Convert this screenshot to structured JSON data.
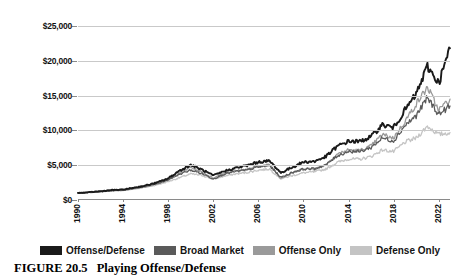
{
  "caption": {
    "figure_number": "FIGURE 20.5",
    "title": "Playing Offense/Defense"
  },
  "legend": {
    "position": "bottom",
    "items": [
      {
        "label": "Offense/Defense",
        "color": "#1a1a1a"
      },
      {
        "label": "Broad Market",
        "color": "#5a5a5a"
      },
      {
        "label": "Offense Only",
        "color": "#9a9a9a"
      },
      {
        "label": "Defense Only",
        "color": "#c4c4c4"
      }
    ]
  },
  "axes": {
    "y_ticks": [
      "$0",
      "$5,000",
      "$10,000",
      "$15,000",
      "$20,000",
      "$25,000"
    ],
    "x_ticks": [
      "1990",
      "1994",
      "1998",
      "2002",
      "2006",
      "2010",
      "2014",
      "2018",
      "2022"
    ]
  },
  "chart_data": {
    "type": "line",
    "title": "Playing Offense/Defense",
    "xlabel": "",
    "ylabel": "",
    "ylim": [
      0,
      25000
    ],
    "xlim": [
      1990,
      2023
    ],
    "grid": true,
    "legend_position": "bottom",
    "x": [
      1990,
      1991,
      1992,
      1993,
      1994,
      1995,
      1996,
      1997,
      1998,
      1999,
      2000,
      2001,
      2002,
      2003,
      2004,
      2005,
      2006,
      2007,
      2008,
      2009,
      2010,
      2011,
      2012,
      2013,
      2014,
      2015,
      2016,
      2017,
      2018,
      2019,
      2020,
      2021,
      2022,
      2023
    ],
    "series": [
      {
        "name": "Offense/Defense",
        "color": "#1a1a1a",
        "values": [
          1000,
          1120,
          1260,
          1420,
          1500,
          1780,
          2080,
          2500,
          3100,
          4200,
          5050,
          4350,
          3500,
          4150,
          4600,
          4950,
          5450,
          5600,
          3900,
          4700,
          5450,
          5550,
          6250,
          7700,
          8450,
          8400,
          9100,
          10800,
          10400,
          12900,
          15200,
          19200,
          16800,
          21800
        ]
      },
      {
        "name": "Broad Market",
        "color": "#5a5a5a",
        "values": [
          1000,
          1100,
          1220,
          1360,
          1420,
          1680,
          1950,
          2350,
          2900,
          3700,
          4300,
          3800,
          3050,
          3750,
          4100,
          4300,
          4750,
          4950,
          3250,
          3950,
          4450,
          4500,
          5050,
          6350,
          7000,
          6950,
          7550,
          8900,
          8500,
          10700,
          12100,
          14700,
          12300,
          13500
        ]
      },
      {
        "name": "Offense Only",
        "color": "#9a9a9a",
        "values": [
          1000,
          1090,
          1210,
          1340,
          1400,
          1650,
          1920,
          2320,
          2900,
          3900,
          4700,
          4000,
          3150,
          3850,
          4200,
          4400,
          4850,
          5050,
          3150,
          3900,
          4500,
          4450,
          5100,
          6600,
          7200,
          7100,
          7750,
          9400,
          8900,
          11300,
          13800,
          16200,
          12900,
          14500
        ]
      },
      {
        "name": "Defense Only",
        "color": "#c4c4c4",
        "values": [
          1000,
          1080,
          1180,
          1300,
          1360,
          1580,
          1830,
          2180,
          2650,
          3200,
          3750,
          3550,
          3000,
          3450,
          3750,
          3950,
          4300,
          4450,
          3050,
          3500,
          3900,
          4050,
          4450,
          5400,
          5900,
          5850,
          6250,
          7200,
          6950,
          8300,
          8900,
          10600,
          9400,
          9700
        ]
      }
    ]
  }
}
